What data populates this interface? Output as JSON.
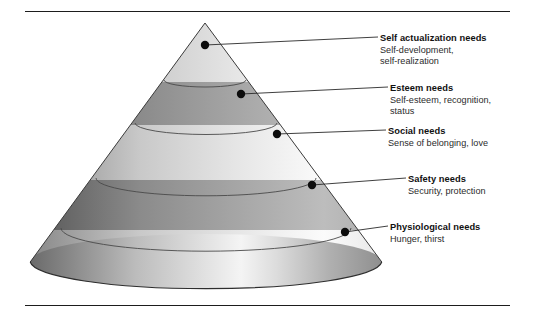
{
  "figure": {
    "background_color": "#ffffff",
    "rule_color": "#1d1d1d",
    "cone": {
      "apex": {
        "x": 205,
        "y": 23
      },
      "base_center": {
        "x": 206,
        "y": 270
      },
      "base_rx": 176,
      "base_ry": 28,
      "outline_color": "#3b3b3b",
      "band_line_color": "#4a4a4a",
      "shade_light": "#f2f2f2",
      "shade_mid": "#b9b9b9",
      "shade_dark": "#7c7c7c",
      "shade_darker": "#5e5e5e",
      "bands": [
        {
          "name": "self-actualization",
          "top_y": 23,
          "bottom_y": 80,
          "tone": "light"
        },
        {
          "name": "esteem",
          "top_y": 80,
          "bottom_y": 123,
          "tone": "dark"
        },
        {
          "name": "social",
          "top_y": 123,
          "bottom_y": 178,
          "tone": "light"
        },
        {
          "name": "safety",
          "top_y": 178,
          "bottom_y": 228,
          "tone": "dark"
        },
        {
          "name": "physiological",
          "top_y": 228,
          "bottom_y": 270,
          "tone": "light"
        }
      ]
    },
    "rules": [
      {
        "name": "top-rule",
        "y": 11,
        "x1": 25,
        "x2": 510
      },
      {
        "name": "bottom-rule",
        "y": 305,
        "x1": 25,
        "x2": 510
      }
    ],
    "leaders": [
      {
        "name": "self-actualization",
        "dot": {
          "x": 205,
          "y": 45
        },
        "end": {
          "x": 378,
          "y": 37
        }
      },
      {
        "name": "esteem",
        "dot": {
          "x": 241,
          "y": 94
        },
        "end": {
          "x": 388,
          "y": 87
        }
      },
      {
        "name": "social",
        "dot": {
          "x": 277,
          "y": 134
        },
        "end": {
          "x": 386,
          "y": 130
        }
      },
      {
        "name": "safety",
        "dot": {
          "x": 312,
          "y": 185
        },
        "end": {
          "x": 406,
          "y": 178
        }
      },
      {
        "name": "physiological",
        "dot": {
          "x": 345,
          "y": 232
        },
        "end": {
          "x": 388,
          "y": 226
        }
      }
    ]
  },
  "levels": [
    {
      "id": "self-actualization",
      "title": "Self actualization needs",
      "desc_lines": [
        "Self-development,",
        "self-realization"
      ]
    },
    {
      "id": "esteem",
      "title": "Esteem needs",
      "desc_lines": [
        "Self-esteem, recognition,",
        "status"
      ]
    },
    {
      "id": "social",
      "title": "Social needs",
      "desc_lines": [
        "Sense of belonging, love"
      ]
    },
    {
      "id": "safety",
      "title": "Safety needs",
      "desc_lines": [
        "Security, protection"
      ]
    },
    {
      "id": "physiological",
      "title": "Physiological needs",
      "desc_lines": [
        "Hunger, thirst"
      ]
    }
  ]
}
